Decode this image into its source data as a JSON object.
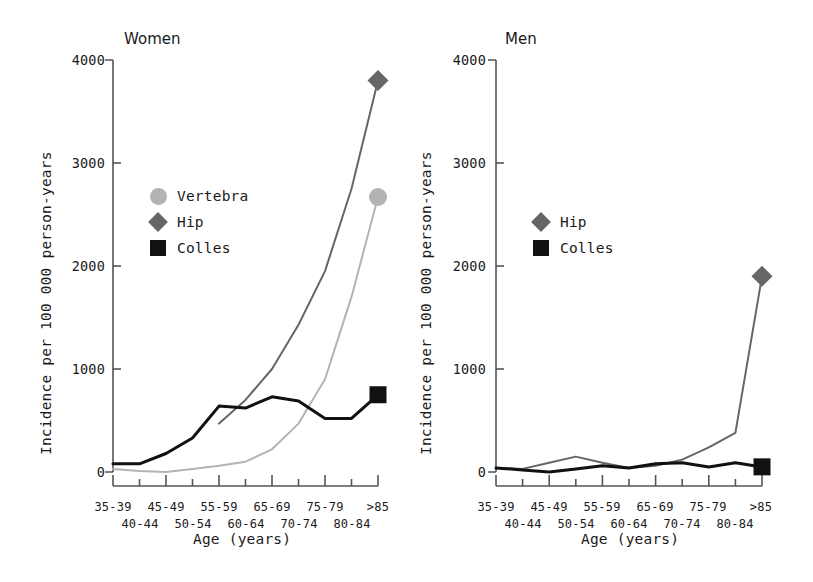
{
  "figure": {
    "width": 813,
    "height": 582,
    "background": "#ffffff"
  },
  "colors": {
    "vertebra": "#b3b3b3",
    "hip": "#666666",
    "colles": "#111111",
    "axis": "#555555",
    "text": "#1a1a1a"
  },
  "axis_titles": {
    "x": "Age (years)",
    "y": "Incidence per 100 000 person-years"
  },
  "ytick_labels": [
    "4000",
    "3000",
    "2000",
    "1000",
    "0"
  ],
  "xtick_labels_top": [
    "35-39",
    "45-49",
    "55-59",
    "65-69",
    "75-79",
    ">85"
  ],
  "xtick_labels_bottom": [
    "40-44",
    "50-54",
    "60-64",
    "70-74",
    "80-84"
  ],
  "panels": {
    "women": {
      "title": "Women",
      "legend": [
        {
          "label": "Vertebra",
          "marker": "circle-icon",
          "color": "#b3b3b3"
        },
        {
          "label": "Hip",
          "marker": "diamond-icon",
          "color": "#666666"
        },
        {
          "label": "Colles",
          "marker": "square-icon",
          "color": "#111111"
        }
      ]
    },
    "men": {
      "title": "Men",
      "legend": [
        {
          "label": "Hip",
          "marker": "diamond-icon",
          "color": "#666666"
        },
        {
          "label": "Colles",
          "marker": "square-icon",
          "color": "#111111"
        }
      ]
    }
  },
  "chart_data": {
    "type": "line",
    "xlabel": "Age (years)",
    "ylabel": "Incidence per 100 000 person-years",
    "categories": [
      "35-39",
      "40-44",
      "45-49",
      "50-54",
      "55-59",
      "60-64",
      "65-69",
      "70-74",
      "75-79",
      "80-84",
      ">85"
    ],
    "ylim": [
      0,
      4000
    ],
    "yticks": [
      0,
      1000,
      2000,
      3000,
      4000
    ],
    "grid": false,
    "legend_position": "inside-upper-left",
    "panels": [
      {
        "name": "Women",
        "series": [
          {
            "name": "Vertebra",
            "color": "#b3b3b3",
            "marker": "circle",
            "marker_at_last_point": true,
            "values": [
              30,
              10,
              0,
              30,
              60,
              100,
              220,
              470,
              900,
              1700,
              2670
            ]
          },
          {
            "name": "Hip",
            "color": "#666666",
            "marker": "diamond",
            "marker_at_last_point": true,
            "values": [
              null,
              null,
              null,
              null,
              470,
              700,
              1000,
              1430,
              1950,
              2750,
              3800
            ]
          },
          {
            "name": "Colles",
            "color": "#111111",
            "marker": "square",
            "marker_at_last_point": true,
            "values": [
              80,
              80,
              180,
              330,
              640,
              620,
              730,
              690,
              520,
              520,
              750
            ]
          }
        ]
      },
      {
        "name": "Men",
        "series": [
          {
            "name": "Hip",
            "color": "#666666",
            "marker": "diamond",
            "marker_at_last_point": true,
            "values": [
              40,
              30,
              90,
              150,
              90,
              40,
              60,
              120,
              240,
              380,
              1900
            ]
          },
          {
            "name": "Colles",
            "color": "#111111",
            "marker": "square",
            "marker_at_last_point": true,
            "values": [
              40,
              20,
              0,
              30,
              60,
              40,
              80,
              90,
              50,
              90,
              50
            ]
          }
        ]
      }
    ]
  }
}
